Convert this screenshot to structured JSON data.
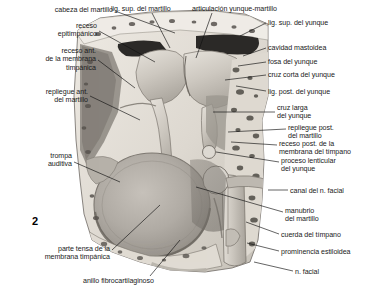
{
  "figure": {
    "number": "2",
    "kind": "anatomical-illustration",
    "style": "grayscale-airbrush"
  },
  "labels": {
    "left": [
      {
        "id": "cabeza-del-martillo",
        "text": [
          "cabeza del martillo"
        ],
        "align": "right",
        "x": 113,
        "y": 6,
        "leader": [
          [
            115,
            11
          ],
          [
            175,
            33
          ]
        ]
      },
      {
        "id": "receso-epitimpanico",
        "text": [
          "receso",
          "epitimpánico"
        ],
        "align": "right",
        "x": 97,
        "y": 22,
        "leader": [
          [
            99,
            31
          ],
          [
            155,
            62
          ]
        ]
      },
      {
        "id": "receso-ant-membrana-timpanica",
        "text": [
          "receso ant.",
          "de la membrana",
          "timpánica"
        ],
        "align": "right",
        "x": 96,
        "y": 47,
        "leader": [
          [
            98,
            60
          ],
          [
            135,
            88
          ]
        ]
      },
      {
        "id": "repliegue-ant-del-martillo",
        "text": [
          "repliegue ant.",
          "del martillo"
        ],
        "align": "right",
        "x": 88,
        "y": 88,
        "leader": [
          [
            90,
            96
          ],
          [
            140,
            120
          ]
        ]
      },
      {
        "id": "trompa-auditiva",
        "text": [
          "trompa",
          "auditiva"
        ],
        "align": "right",
        "x": 72,
        "y": 152,
        "leader": [
          [
            74,
            162
          ],
          [
            120,
            182
          ]
        ]
      },
      {
        "id": "parte-tensa-membrana-timpanica",
        "text": [
          "parte tensa de la",
          "membrana timpánica"
        ],
        "align": "right",
        "x": 110,
        "y": 245,
        "leader": [
          [
            112,
            250
          ],
          [
            160,
            205
          ]
        ]
      },
      {
        "id": "anillo-fibrocartilaginoso",
        "text": [
          "anillo fibrocartilaginoso"
        ],
        "align": "left",
        "x": 83,
        "y": 277,
        "leader": [
          [
            150,
            276
          ],
          [
            180,
            240
          ]
        ]
      }
    ],
    "top": [
      {
        "id": "lig-sup-del-martillo",
        "text": [
          "lig. sup. del martillo"
        ],
        "align": "center",
        "x": 111,
        "y": 5,
        "leader": [
          [
            152,
            13
          ],
          [
            170,
            48
          ]
        ]
      },
      {
        "id": "articulacion-yunque-martillo",
        "text": [
          "articulación yunque-martillo"
        ],
        "align": "left",
        "x": 192,
        "y": 5,
        "leader": [
          [
            212,
            13
          ],
          [
            196,
            58
          ]
        ]
      }
    ],
    "right": [
      {
        "id": "lig-sup-del-yunque",
        "text": [
          "lig. sup. del yunque"
        ],
        "align": "left",
        "x": 268,
        "y": 19,
        "leader": [
          [
            266,
            23
          ],
          [
            240,
            36
          ]
        ]
      },
      {
        "id": "cavidad-mastoidea",
        "text": [
          "cavidad mastoidea"
        ],
        "align": "left",
        "x": 268,
        "y": 44,
        "leader": [
          [
            266,
            48
          ],
          [
            243,
            56
          ]
        ]
      },
      {
        "id": "fosa-del-yunque",
        "text": [
          "fosa del yunque"
        ],
        "align": "left",
        "x": 268,
        "y": 58,
        "leader": [
          [
            266,
            62
          ],
          [
            238,
            66
          ]
        ]
      },
      {
        "id": "cruz-corta-del-yunque",
        "text": [
          "cruz corta del yunque"
        ],
        "align": "left",
        "x": 268,
        "y": 71,
        "leader": [
          [
            266,
            75
          ],
          [
            225,
            80
          ]
        ]
      },
      {
        "id": "lig-post-del-yunque",
        "text": [
          "lig. post. del yunque"
        ],
        "align": "left",
        "x": 268,
        "y": 88,
        "leader": [
          [
            266,
            91
          ],
          [
            236,
            86
          ]
        ]
      },
      {
        "id": "cruz-larga-del-yunque",
        "text": [
          "cruz larga",
          "del yunque"
        ],
        "align": "left",
        "x": 277,
        "y": 104,
        "leader": [
          [
            275,
            112
          ],
          [
            213,
            112
          ]
        ]
      },
      {
        "id": "repliegue-post-del-martillo",
        "text": [
          "repliegue post.",
          "del martillo"
        ],
        "align": "left",
        "x": 288,
        "y": 124,
        "leader": [
          [
            286,
            129
          ],
          [
            228,
            132
          ]
        ]
      },
      {
        "id": "receso-post-membrana-timpano",
        "text": [
          "receso post. de la",
          "membrana del tímpano"
        ],
        "align": "left",
        "x": 279,
        "y": 140,
        "leader": [
          [
            277,
            145
          ],
          [
            231,
            142
          ]
        ]
      },
      {
        "id": "proceso-lenticular-del-yunque",
        "text": [
          "proceso lenticular",
          "del yunque"
        ],
        "align": "left",
        "x": 281,
        "y": 157,
        "leader": [
          [
            279,
            162
          ],
          [
            216,
            152
          ]
        ]
      },
      {
        "id": "canal-del-n-facial",
        "text": [
          "canal del n. facial"
        ],
        "align": "left",
        "x": 290,
        "y": 187,
        "leader": [
          [
            288,
            190
          ],
          [
            268,
            190
          ]
        ]
      },
      {
        "id": "manubrio-del-martillo",
        "text": [
          "manubrio",
          "del martillo"
        ],
        "align": "left",
        "x": 285,
        "y": 207,
        "leader": [
          [
            283,
            212
          ],
          [
            196,
            187
          ]
        ]
      },
      {
        "id": "cuerda-del-timpano",
        "text": [
          "cuerda del tímpano"
        ],
        "align": "left",
        "x": 281,
        "y": 231,
        "leader": [
          [
            279,
            234
          ],
          [
            246,
            222
          ]
        ]
      },
      {
        "id": "prominencia-estiloidea",
        "text": [
          "prominencia estiloidea"
        ],
        "align": "left",
        "x": 281,
        "y": 248,
        "leader": [
          [
            279,
            251
          ],
          [
            247,
            243
          ]
        ]
      },
      {
        "id": "n-facial",
        "text": [
          "n. facial"
        ],
        "align": "left",
        "x": 295,
        "y": 268,
        "leader": [
          [
            293,
            271
          ],
          [
            254,
            262
          ]
        ]
      }
    ]
  },
  "colors": {
    "background": "#ffffff",
    "text": "#1a1a1a",
    "leader": "#111111",
    "bone_light": "#e7e3dc",
    "bone_mid": "#cfc9c0",
    "bone_shadow": "#a9a39a",
    "cavity_dark": "#2e2c2a",
    "ossicle_light": "#d8d4cd",
    "ossicle_mid": "#b9b4ac",
    "membrane": "#b2ada6",
    "membrane_dark": "#9b968f",
    "speckle": "#54504b"
  }
}
